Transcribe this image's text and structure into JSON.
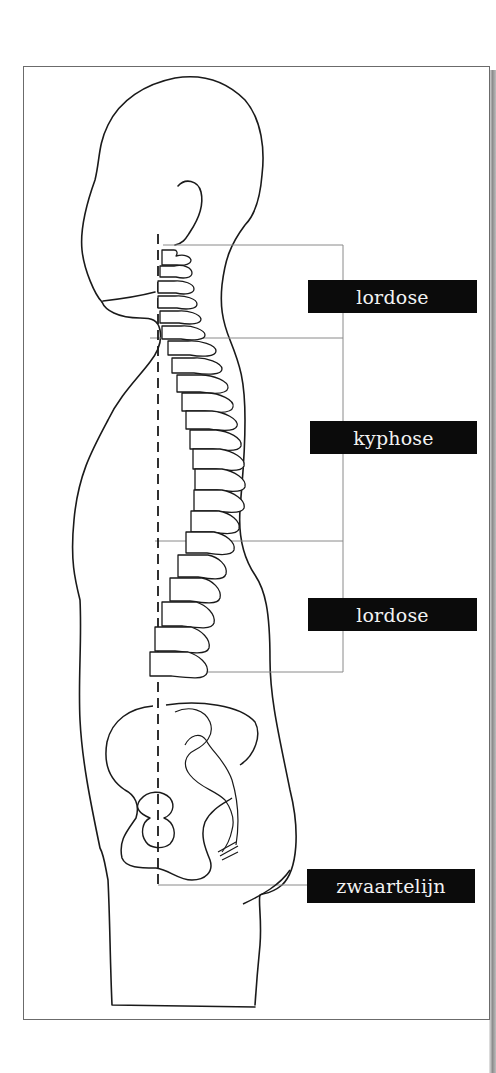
{
  "figure": {
    "labels": [
      {
        "id": "cervical",
        "text": "lordose"
      },
      {
        "id": "thoracic",
        "text": "kyphose"
      },
      {
        "id": "lumbar",
        "text": "lordose"
      },
      {
        "id": "plumb",
        "text": "zwaartelijn"
      }
    ]
  },
  "colors": {
    "label_bg": "#0b0b0b",
    "label_text": "#f2f2f2",
    "line": "#1a1a1a",
    "guide_line": "#8a8a8a"
  }
}
